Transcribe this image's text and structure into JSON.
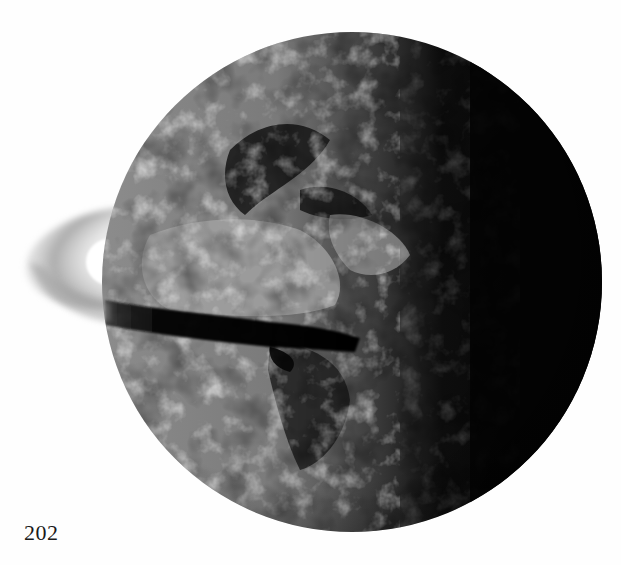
{
  "page": {
    "page_number": "202",
    "background": "#ffffff"
  },
  "figure": {
    "globe": {
      "cx": 352,
      "cy": 282,
      "r": 250,
      "lit_color": "#9a9a9a",
      "dark_color": "#050505"
    },
    "ring": {
      "color": "#b8b8b8",
      "shadow_color": "#0a0a0a"
    }
  }
}
